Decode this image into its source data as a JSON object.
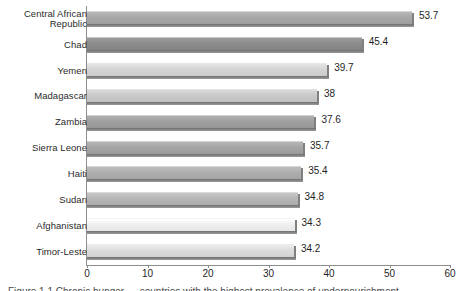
{
  "chart_data": {
    "type": "bar",
    "orientation": "horizontal",
    "title": "",
    "xlabel": "",
    "ylabel": "",
    "xlim": [
      0,
      60
    ],
    "xticks": [
      "0",
      "10",
      "20",
      "30",
      "40",
      "50",
      "60"
    ],
    "grid": false,
    "legend": null,
    "categories": [
      "Central African\nRepublic",
      "Chad",
      "Yemen",
      "Madagascar",
      "Zambia",
      "Sierra Leone",
      "Haiti",
      "Sudan",
      "Afghanistan",
      "Timor-Leste"
    ],
    "values": [
      53.7,
      45.4,
      39.7,
      38,
      37.6,
      35.7,
      35.4,
      34.8,
      34.3,
      34.2
    ],
    "value_labels": [
      "53.7",
      "45.4",
      "39.7",
      "38",
      "37.6",
      "35.7",
      "35.4",
      "34.8",
      "34.3",
      "34.2"
    ],
    "bar_colors": [
      "#a8a8a8",
      "#8c8c8c",
      "#d4d4d4",
      "#c9c9c9",
      "#a0a0a0",
      "#a5a5a5",
      "#aeaeae",
      "#b6b6b6",
      "#f0f0f0",
      "#dcdcdc"
    ]
  },
  "axis": {
    "axis_line_color": "#8d8d8d"
  },
  "caption": {
    "text": "Figure 1.1 Chronic hunger — countries with the highest prevalence of undernourishment"
  }
}
